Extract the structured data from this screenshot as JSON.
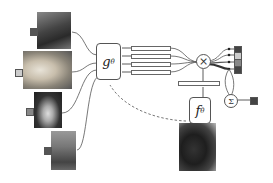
{
  "diagram": {
    "support_images": [
      {
        "id": "dog-1",
        "label_color": "#555555",
        "desc": "small dark dog portrait"
      },
      {
        "id": "dog-2",
        "label_color": "#cccccc",
        "desc": "golden retriever lying"
      },
      {
        "id": "dog-3",
        "label_color": "#888888",
        "desc": "husky portrait"
      },
      {
        "id": "dog-4",
        "label_color": "#555555",
        "desc": "german shepherd in grass"
      }
    ],
    "query_image": {
      "desc": "german shepherd close-up"
    },
    "g_module": {
      "symbol": "g",
      "subscript": "θ"
    },
    "f_module": {
      "symbol": "f",
      "subscript": "θ"
    },
    "multiply_symbol": "×",
    "sum_symbol": "Σ",
    "output_labels": [
      "#444444",
      "#cccccc",
      "#888888",
      "#444444"
    ],
    "final_output_color": "#444444"
  }
}
